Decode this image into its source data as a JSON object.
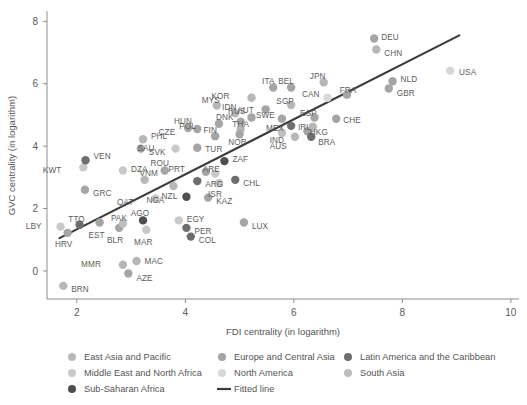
{
  "chart_data": {
    "type": "scatter",
    "title": "",
    "xlabel": "FDI centrality (in logarithm)",
    "ylabel": "GVC centrality (in logarithm)",
    "xlim": [
      1.45,
      10.15
    ],
    "ylim": [
      -0.9,
      8.3
    ],
    "xticks": [
      2,
      4,
      6,
      8,
      10
    ],
    "yticks": [
      0,
      2,
      4,
      6,
      8
    ],
    "grid": false,
    "legend_position": "bottom",
    "groups": [
      {
        "key": "east_asia_pacific",
        "label": "East Asia and Pacific",
        "color": "#b7b7b7"
      },
      {
        "key": "europe_central_asia",
        "label": "Europe and Central Asia",
        "color": "#a5a5a5"
      },
      {
        "key": "latin_america_caribbean",
        "label": "Latin America and the Caribbean",
        "color": "#6e6e6e"
      },
      {
        "key": "middle_east_north_africa",
        "label": "Middle East and North Africa",
        "color": "#c9c9c9"
      },
      {
        "key": "north_america",
        "label": "North America",
        "color": "#d8d8d8"
      },
      {
        "key": "south_asia",
        "label": "South Asia",
        "color": "#bfbfbf"
      },
      {
        "key": "sub_saharan_africa",
        "label": "Sub-Saharan Africa",
        "color": "#4f4f4f"
      }
    ],
    "fitted_line": {
      "label": "Fitted line",
      "color": "#3b3b3b",
      "x": [
        1.68,
        9.05
      ],
      "y": [
        1.05,
        7.55
      ]
    },
    "points": [
      {
        "code": "BRN",
        "x": 1.75,
        "y": -0.48,
        "g": "east_asia_pacific",
        "lx": 8,
        "ly": 3
      },
      {
        "code": "LBY",
        "x": 1.7,
        "y": 1.42,
        "g": "middle_east_north_africa",
        "lx": -19,
        "ly": -1
      },
      {
        "code": "HRV",
        "x": 1.83,
        "y": 1.22,
        "g": "europe_central_asia",
        "lx": -4,
        "ly": 11
      },
      {
        "code": "TTO",
        "x": 2.05,
        "y": 1.48,
        "g": "latin_america_caribbean",
        "lx": -3,
        "ly": -6
      },
      {
        "code": "KWT",
        "x": 2.12,
        "y": 3.32,
        "g": "middle_east_north_africa",
        "lx": -22,
        "ly": 3
      },
      {
        "code": "VEN",
        "x": 2.16,
        "y": 3.55,
        "g": "latin_america_caribbean",
        "lx": 8,
        "ly": -4
      },
      {
        "code": "GRC",
        "x": 2.15,
        "y": 2.6,
        "g": "europe_central_asia",
        "lx": 8,
        "ly": 3
      },
      {
        "code": "EST",
        "x": 2.42,
        "y": 1.55,
        "g": "europe_central_asia",
        "lx": -3,
        "ly": 12
      },
      {
        "code": "BLR",
        "x": 2.78,
        "y": 1.38,
        "g": "europe_central_asia",
        "lx": -4,
        "ly": 12
      },
      {
        "code": "PAK",
        "x": 2.85,
        "y": 1.52,
        "g": "south_asia",
        "lx": -4,
        "ly": -6
      },
      {
        "code": "MMR",
        "x": 2.85,
        "y": 0.2,
        "g": "east_asia_pacific",
        "lx": -22,
        "ly": -1
      },
      {
        "code": "AZE",
        "x": 2.95,
        "y": -0.08,
        "g": "europe_central_asia",
        "lx": 8,
        "ly": 5
      },
      {
        "code": "MAC",
        "x": 3.1,
        "y": 0.32,
        "g": "east_asia_pacific",
        "lx": 8,
        "ly": 0
      },
      {
        "code": "DZA",
        "x": 2.85,
        "y": 3.22,
        "g": "middle_east_north_africa",
        "lx": 8,
        "ly": -1
      },
      {
        "code": "PHL",
        "x": 3.22,
        "y": 4.22,
        "g": "east_asia_pacific",
        "lx": 8,
        "ly": -3
      },
      {
        "code": "SVK",
        "x": 3.18,
        "y": 3.92,
        "g": "europe_central_asia",
        "lx": 8,
        "ly": 3
      },
      {
        "code": "VNM",
        "x": 3.25,
        "y": 2.92,
        "g": "east_asia_pacific",
        "lx": 4,
        "ly": -7
      },
      {
        "code": "MAR",
        "x": 3.28,
        "y": 1.32,
        "g": "middle_east_north_africa",
        "lx": -3,
        "ly": 12
      },
      {
        "code": "AGO",
        "x": 3.22,
        "y": 1.62,
        "g": "sub_saharan_africa",
        "lx": -3,
        "ly": -7
      },
      {
        "code": "QAT",
        "x": 3.45,
        "y": 2.32,
        "g": "middle_east_north_africa",
        "lx": -22,
        "ly": 3
      },
      {
        "code": "ROU",
        "x": 3.62,
        "y": 3.22,
        "g": "europe_central_asia",
        "lx": -5,
        "ly": -7
      },
      {
        "code": "SAU",
        "x": 3.82,
        "y": 3.92,
        "g": "middle_east_north_africa",
        "lx": -21,
        "ly": -1
      },
      {
        "code": "NZL",
        "x": 3.78,
        "y": 2.72,
        "g": "east_asia_pacific",
        "lx": -4,
        "ly": 10
      },
      {
        "code": "NGA",
        "x": 4.02,
        "y": 2.38,
        "g": "sub_saharan_africa",
        "lx": -22,
        "ly": 3
      },
      {
        "code": "EGY",
        "x": 3.88,
        "y": 1.62,
        "g": "middle_east_north_africa",
        "lx": 8,
        "ly": -1
      },
      {
        "code": "PER",
        "x": 4.02,
        "y": 1.38,
        "g": "latin_america_caribbean",
        "lx": 8,
        "ly": 3
      },
      {
        "code": "COL",
        "x": 4.1,
        "y": 1.1,
        "g": "latin_america_caribbean",
        "lx": 8,
        "ly": 3
      },
      {
        "code": "KAZ",
        "x": 4.42,
        "y": 2.35,
        "g": "europe_central_asia",
        "lx": 8,
        "ly": 3
      },
      {
        "code": "ARG",
        "x": 4.22,
        "y": 2.88,
        "g": "latin_america_caribbean",
        "lx": 8,
        "ly": 3
      },
      {
        "code": "PRT",
        "x": 4.38,
        "y": 3.18,
        "g": "europe_central_asia",
        "lx": -21,
        "ly": -3
      },
      {
        "code": "ARE",
        "x": 4.55,
        "y": 3.12,
        "g": "middle_east_north_africa",
        "lx": -4,
        "ly": -5
      },
      {
        "code": "ISR",
        "x": 4.62,
        "y": 2.82,
        "g": "middle_east_north_africa",
        "lx": -4,
        "ly": 11
      },
      {
        "code": "ZAF",
        "x": 4.72,
        "y": 3.52,
        "g": "sub_saharan_africa",
        "lx": 8,
        "ly": -2
      },
      {
        "code": "CHL",
        "x": 4.92,
        "y": 2.92,
        "g": "latin_america_caribbean",
        "lx": 8,
        "ly": 3
      },
      {
        "code": "TUR",
        "x": 4.22,
        "y": 3.95,
        "g": "europe_central_asia",
        "lx": 8,
        "ly": 1
      },
      {
        "code": "FIN",
        "x": 4.55,
        "y": 4.32,
        "g": "europe_central_asia",
        "lx": -5,
        "ly": -6
      },
      {
        "code": "CZE",
        "x": 4.22,
        "y": 4.55,
        "g": "europe_central_asia",
        "lx": -22,
        "ly": 3
      },
      {
        "code": "POL",
        "x": 4.62,
        "y": 4.72,
        "g": "europe_central_asia",
        "lx": -23,
        "ly": 2
      },
      {
        "code": "HUN",
        "x": 4.05,
        "y": 4.58,
        "g": "europe_central_asia",
        "lx": -5,
        "ly": -7
      },
      {
        "code": "MYS",
        "x": 4.58,
        "y": 5.3,
        "g": "east_asia_pacific",
        "lx": -6,
        "ly": -6
      },
      {
        "code": "IDN",
        "x": 4.92,
        "y": 5.05,
        "g": "east_asia_pacific",
        "lx": -6,
        "ly": -6
      },
      {
        "code": "DNK",
        "x": 5.02,
        "y": 4.78,
        "g": "europe_central_asia",
        "lx": -7,
        "ly": -5
      },
      {
        "code": "AUT",
        "x": 5.22,
        "y": 4.92,
        "g": "europe_central_asia",
        "lx": -6,
        "ly": -7
      },
      {
        "code": "THA",
        "x": 5.02,
        "y": 4.55,
        "g": "east_asia_pacific",
        "lx": 0,
        "ly": -5
      },
      {
        "code": "NOR",
        "x": 5.0,
        "y": 4.38,
        "g": "europe_central_asia",
        "lx": -2,
        "ly": 8
      },
      {
        "code": "LUX",
        "x": 5.08,
        "y": 1.55,
        "g": "europe_central_asia",
        "lx": 8,
        "ly": 3
      },
      {
        "code": "KOR",
        "x": 5.22,
        "y": 5.55,
        "g": "east_asia_pacific",
        "lx": -22,
        "ly": -2
      },
      {
        "code": "RUS",
        "x": 5.48,
        "y": 5.18,
        "g": "europe_central_asia",
        "lx": -20,
        "ly": 2
      },
      {
        "code": "ITA",
        "x": 5.62,
        "y": 5.88,
        "g": "europe_central_asia",
        "lx": -5,
        "ly": -6
      },
      {
        "code": "BEL",
        "x": 5.95,
        "y": 5.88,
        "g": "europe_central_asia",
        "lx": -5,
        "ly": -6
      },
      {
        "code": "SGP",
        "x": 5.95,
        "y": 5.32,
        "g": "east_asia_pacific",
        "lx": -6,
        "ly": -4
      },
      {
        "code": "SWE",
        "x": 5.78,
        "y": 4.88,
        "g": "europe_central_asia",
        "lx": -7,
        "ly": -4
      },
      {
        "code": "MEX",
        "x": 5.95,
        "y": 4.65,
        "g": "latin_america_caribbean",
        "lx": -7,
        "ly": 2
      },
      {
        "code": "IND",
        "x": 5.78,
        "y": 4.42,
        "g": "south_asia",
        "lx": -5,
        "ly": 7
      },
      {
        "code": "AUS",
        "x": 6.02,
        "y": 4.3,
        "g": "east_asia_pacific",
        "lx": -8,
        "ly": 9
      },
      {
        "code": "IRL",
        "x": 6.25,
        "y": 4.48,
        "g": "europe_central_asia",
        "lx": -3,
        "ly": -4
      },
      {
        "code": "BRA",
        "x": 6.32,
        "y": 4.3,
        "g": "latin_america_caribbean",
        "lx": 7,
        "ly": 5
      },
      {
        "code": "ESP",
        "x": 6.38,
        "y": 4.92,
        "g": "europe_central_asia",
        "lx": -6,
        "ly": -4
      },
      {
        "code": "HKG",
        "x": 6.35,
        "y": 4.62,
        "g": "east_asia_pacific",
        "lx": 6,
        "ly": 5
      },
      {
        "code": "CHE",
        "x": 6.78,
        "y": 4.88,
        "g": "europe_central_asia",
        "lx": 7,
        "ly": 1
      },
      {
        "code": "JPN",
        "x": 6.55,
        "y": 6.05,
        "g": "east_asia_pacific",
        "lx": -6,
        "ly": -6
      },
      {
        "code": "CAN",
        "x": 6.62,
        "y": 5.55,
        "g": "north_america",
        "lx": -8,
        "ly": -4
      },
      {
        "code": "FRA",
        "x": 6.98,
        "y": 5.65,
        "g": "europe_central_asia",
        "lx": 1,
        "ly": -5
      },
      {
        "code": "DEU",
        "x": 7.48,
        "y": 7.45,
        "g": "europe_central_asia",
        "lx": 7,
        "ly": -2
      },
      {
        "code": "CHN",
        "x": 7.52,
        "y": 7.1,
        "g": "east_asia_pacific",
        "lx": 8,
        "ly": 4
      },
      {
        "code": "NLD",
        "x": 7.82,
        "y": 6.08,
        "g": "europe_central_asia",
        "lx": 8,
        "ly": -2
      },
      {
        "code": "GBR",
        "x": 7.75,
        "y": 5.85,
        "g": "europe_central_asia",
        "lx": 8,
        "ly": 5
      },
      {
        "code": "USA",
        "x": 8.88,
        "y": 6.42,
        "g": "north_america",
        "lx": 9,
        "ly": 1
      }
    ]
  },
  "legend": {
    "entries": [
      {
        "name": "East Asia and Pacific",
        "color": "#b7b7b7",
        "marker": "dot"
      },
      {
        "name": "Europe and Central Asia",
        "color": "#a5a5a5",
        "marker": "dot"
      },
      {
        "name": "Latin America and the Caribbean",
        "color": "#6e6e6e",
        "marker": "dot"
      },
      {
        "name": "Middle East and North Africa",
        "color": "#c9c9c9",
        "marker": "dot"
      },
      {
        "name": "North America",
        "color": "#d8d8d8",
        "marker": "dot"
      },
      {
        "name": "South Asia",
        "color": "#bfbfbf",
        "marker": "dot"
      },
      {
        "name": "Sub-Saharan Africa",
        "color": "#4f4f4f",
        "marker": "dot"
      },
      {
        "name": "Fitted line",
        "color": "#3b3b3b",
        "marker": "line"
      }
    ]
  }
}
